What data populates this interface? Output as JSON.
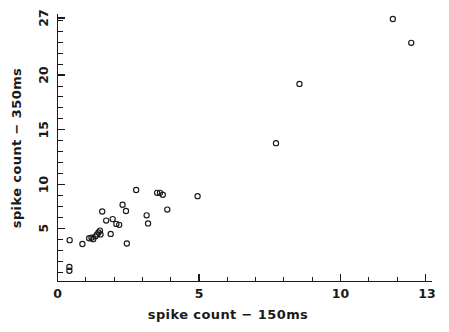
{
  "chart_data": {
    "type": "scatter",
    "title": "",
    "xlabel": "spike count − 150ms",
    "ylabel": "spike count − 350ms",
    "xlim": [
      0,
      13
    ],
    "ylim": [
      0,
      27
    ],
    "grid": false,
    "legend": null,
    "xticks": [
      0,
      5,
      10,
      13
    ],
    "xtick_labels": [
      "0",
      "5",
      "10",
      "13"
    ],
    "yticks": [
      5,
      10,
      15,
      20,
      27
    ],
    "ytick_labels": [
      "5",
      "10",
      "15",
      "20",
      "27"
    ],
    "x_minor_tick_step": 1,
    "y_minor_tick_step": 1,
    "marker": "open-circle",
    "marker_color": "#1a1a1a",
    "n_points": 32,
    "points": [
      {
        "x": 0.42,
        "y": 0.55
      },
      {
        "x": 0.42,
        "y": 0.95
      },
      {
        "x": 0.43,
        "y": 3.75
      },
      {
        "x": 0.88,
        "y": 3.35
      },
      {
        "x": 1.12,
        "y": 3.95
      },
      {
        "x": 1.2,
        "y": 4.0
      },
      {
        "x": 1.26,
        "y": 3.85
      },
      {
        "x": 1.34,
        "y": 4.15
      },
      {
        "x": 1.4,
        "y": 4.35
      },
      {
        "x": 1.45,
        "y": 4.55
      },
      {
        "x": 1.5,
        "y": 4.75
      },
      {
        "x": 1.52,
        "y": 4.35
      },
      {
        "x": 1.58,
        "y": 6.75
      },
      {
        "x": 1.72,
        "y": 5.8
      },
      {
        "x": 1.88,
        "y": 4.4
      },
      {
        "x": 1.95,
        "y": 5.95
      },
      {
        "x": 2.08,
        "y": 5.45
      },
      {
        "x": 2.18,
        "y": 5.35
      },
      {
        "x": 2.3,
        "y": 7.45
      },
      {
        "x": 2.42,
        "y": 6.8
      },
      {
        "x": 2.45,
        "y": 3.4
      },
      {
        "x": 2.78,
        "y": 9.0
      },
      {
        "x": 3.15,
        "y": 6.35
      },
      {
        "x": 3.2,
        "y": 5.5
      },
      {
        "x": 3.52,
        "y": 8.7
      },
      {
        "x": 3.62,
        "y": 8.7
      },
      {
        "x": 3.72,
        "y": 8.5
      },
      {
        "x": 3.88,
        "y": 6.95
      },
      {
        "x": 4.95,
        "y": 8.35
      },
      {
        "x": 7.72,
        "y": 13.9
      },
      {
        "x": 8.55,
        "y": 20.1
      },
      {
        "x": 11.85,
        "y": 26.9
      },
      {
        "x": 12.5,
        "y": 24.4
      }
    ]
  },
  "axes": {
    "x_title": "spike count − 150ms",
    "y_title": "spike count − 350ms",
    "x_labels": [
      "0",
      "5",
      "10",
      "13"
    ],
    "y_labels": [
      "5",
      "10",
      "15",
      "20",
      "27"
    ]
  }
}
